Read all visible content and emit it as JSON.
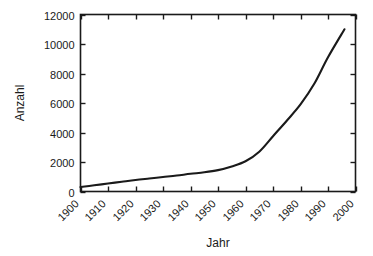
{
  "chart_data": {
    "type": "line",
    "title": "",
    "xlabel": "Jahr",
    "ylabel": "Anzahl",
    "xlim": [
      1900,
      2000
    ],
    "ylim": [
      0,
      12000
    ],
    "grid": false,
    "legend": null,
    "x_ticks": [
      "1900",
      "1910",
      "1920",
      "1930",
      "1940",
      "1950",
      "1960",
      "1970",
      "1980",
      "1990",
      "2000"
    ],
    "y_ticks": [
      "0",
      "2000",
      "4000",
      "6000",
      "8000",
      "10000",
      "12000"
    ],
    "line_color": "#1a1a1a",
    "x": [
      1900,
      1905,
      1910,
      1915,
      1920,
      1925,
      1930,
      1935,
      1940,
      1945,
      1950,
      1955,
      1960,
      1965,
      1970,
      1975,
      1980,
      1985,
      1990,
      1996
    ],
    "values": [
      300,
      420,
      540,
      660,
      780,
      880,
      980,
      1080,
      1200,
      1300,
      1450,
      1700,
      2050,
      2700,
      3750,
      4800,
      5900,
      7300,
      9100,
      11000
    ],
    "series": [
      {
        "name": "Anzahl",
        "values": [
          300,
          420,
          540,
          660,
          780,
          880,
          980,
          1080,
          1200,
          1300,
          1450,
          1700,
          2050,
          2700,
          3750,
          4800,
          5900,
          7300,
          9100,
          11000
        ]
      }
    ]
  }
}
